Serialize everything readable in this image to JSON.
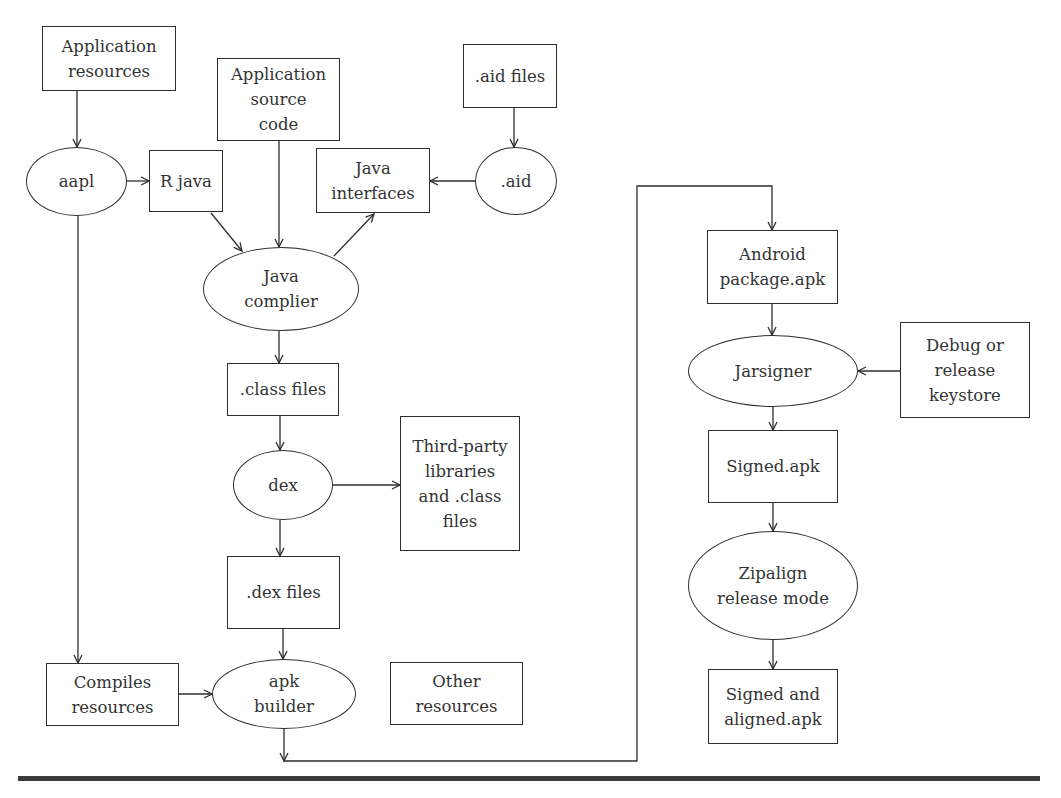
{
  "diagram": {
    "nodes": [
      {
        "id": "app-resources",
        "shape": "box",
        "label": "Application\nresources",
        "x": 42,
        "y": 26,
        "w": 134,
        "h": 65
      },
      {
        "id": "aapl",
        "shape": "ellipse",
        "label": "aapl",
        "x": 26,
        "y": 147,
        "w": 101,
        "h": 69
      },
      {
        "id": "r-java",
        "shape": "box",
        "label": "R java",
        "x": 149,
        "y": 150,
        "w": 74,
        "h": 62
      },
      {
        "id": "app-source-code",
        "shape": "box",
        "label": "Application\nsource\ncode",
        "x": 217,
        "y": 58,
        "w": 123,
        "h": 83
      },
      {
        "id": "java-interfaces",
        "shape": "box",
        "label": "Java\ninterfaces",
        "x": 316,
        "y": 148,
        "w": 114,
        "h": 65
      },
      {
        "id": "aid-files",
        "shape": "box",
        "label": ".aid files",
        "x": 463,
        "y": 44,
        "w": 94,
        "h": 64
      },
      {
        "id": "aid",
        "shape": "ellipse",
        "label": ".aid",
        "x": 475,
        "y": 147,
        "w": 82,
        "h": 68
      },
      {
        "id": "java-compiler",
        "shape": "ellipse",
        "label": "Java\ncomplier",
        "x": 203,
        "y": 247,
        "w": 156,
        "h": 84
      },
      {
        "id": "class-files",
        "shape": "box",
        "label": ".class files",
        "x": 227,
        "y": 363,
        "w": 112,
        "h": 53
      },
      {
        "id": "dex",
        "shape": "ellipse",
        "label": "dex",
        "x": 233,
        "y": 450,
        "w": 100,
        "h": 70
      },
      {
        "id": "third-party",
        "shape": "box",
        "label": "Third-party\nlibraries\nand .class\nfiles",
        "x": 400,
        "y": 416,
        "w": 120,
        "h": 135
      },
      {
        "id": "dex-files",
        "shape": "box",
        "label": ".dex files",
        "x": 227,
        "y": 556,
        "w": 113,
        "h": 73
      },
      {
        "id": "compiles-resources",
        "shape": "box",
        "label": "Compiles\nresources",
        "x": 46,
        "y": 663,
        "w": 133,
        "h": 63
      },
      {
        "id": "apk-builder",
        "shape": "ellipse",
        "label": "apk\nbuilder",
        "x": 212,
        "y": 659,
        "w": 144,
        "h": 70
      },
      {
        "id": "other-resources",
        "shape": "box",
        "label": "Other\nresources",
        "x": 390,
        "y": 662,
        "w": 133,
        "h": 63
      },
      {
        "id": "android-package",
        "shape": "box",
        "label": "Android\npackage.apk",
        "x": 707,
        "y": 230,
        "w": 131,
        "h": 74
      },
      {
        "id": "jarsigner",
        "shape": "ellipse",
        "label": "Jarsigner",
        "x": 688,
        "y": 335,
        "w": 170,
        "h": 72
      },
      {
        "id": "debug-release-keystore",
        "shape": "box",
        "label": "Debug or\nrelease\nkeystore",
        "x": 900,
        "y": 322,
        "w": 130,
        "h": 96
      },
      {
        "id": "signed-apk",
        "shape": "box",
        "label": "Signed.apk",
        "x": 708,
        "y": 430,
        "w": 130,
        "h": 73
      },
      {
        "id": "zipalign",
        "shape": "ellipse",
        "label": "Zipalign\nrelease mode",
        "x": 688,
        "y": 531,
        "w": 170,
        "h": 109
      },
      {
        "id": "signed-aligned-apk",
        "shape": "box",
        "label": "Signed and\naligned.apk",
        "x": 708,
        "y": 669,
        "w": 130,
        "h": 75
      }
    ],
    "edges": [
      {
        "from": "app-resources",
        "to": "aapl",
        "points": [
          [
            77,
            91
          ],
          [
            77,
            147
          ]
        ]
      },
      {
        "from": "aapl",
        "to": "r-java",
        "points": [
          [
            127,
            181
          ],
          [
            149,
            181
          ]
        ]
      },
      {
        "from": "r-java",
        "to": "java-compiler",
        "points": [
          [
            211,
            213
          ],
          [
            242,
            251
          ]
        ]
      },
      {
        "from": "app-source-code",
        "to": "java-compiler",
        "points": [
          [
            279,
            141
          ],
          [
            279,
            247
          ]
        ]
      },
      {
        "from": "java-compiler",
        "to": "java-interfaces",
        "points": [
          [
            334,
            256
          ],
          [
            374,
            214
          ]
        ]
      },
      {
        "from": "aid-files",
        "to": "aid",
        "points": [
          [
            514,
            108
          ],
          [
            514,
            147
          ]
        ]
      },
      {
        "from": "aid",
        "to": "java-interfaces",
        "points": [
          [
            475,
            181
          ],
          [
            430,
            181
          ]
        ]
      },
      {
        "from": "java-compiler",
        "to": "class-files",
        "points": [
          [
            279,
            331
          ],
          [
            279,
            363
          ]
        ]
      },
      {
        "from": "class-files",
        "to": "dex",
        "points": [
          [
            280,
            416
          ],
          [
            280,
            450
          ]
        ]
      },
      {
        "from": "dex",
        "to": "third-party",
        "points": [
          [
            333,
            485
          ],
          [
            400,
            485
          ]
        ]
      },
      {
        "from": "dex",
        "to": "dex-files",
        "points": [
          [
            280,
            520
          ],
          [
            280,
            556
          ]
        ]
      },
      {
        "from": "dex-files",
        "to": "apk-builder",
        "points": [
          [
            283,
            629
          ],
          [
            283,
            659
          ]
        ]
      },
      {
        "from": "aapl",
        "to": "compiles-resources",
        "points": [
          [
            78,
            216
          ],
          [
            78,
            663
          ]
        ]
      },
      {
        "from": "compiles-resources",
        "to": "apk-builder",
        "points": [
          [
            179,
            694
          ],
          [
            212,
            694
          ]
        ]
      },
      {
        "from": "apk-builder",
        "to": "android-package",
        "points": [
          [
            284,
            729
          ],
          [
            284,
            761
          ],
          [
            637,
            761
          ],
          [
            637,
            186
          ],
          [
            772,
            186
          ],
          [
            772,
            230
          ]
        ],
        "arrow_at_start_down": true
      },
      {
        "from": "android-package",
        "to": "jarsigner",
        "points": [
          [
            772,
            304
          ],
          [
            772,
            335
          ]
        ]
      },
      {
        "from": "debug-release-keystore",
        "to": "jarsigner",
        "points": [
          [
            900,
            371
          ],
          [
            858,
            371
          ]
        ]
      },
      {
        "from": "jarsigner",
        "to": "signed-apk",
        "points": [
          [
            773,
            407
          ],
          [
            773,
            430
          ]
        ]
      },
      {
        "from": "signed-apk",
        "to": "zipalign",
        "points": [
          [
            773,
            503
          ],
          [
            773,
            531
          ]
        ]
      },
      {
        "from": "zipalign",
        "to": "signed-aligned-apk",
        "points": [
          [
            773,
            640
          ],
          [
            773,
            669
          ]
        ]
      }
    ],
    "colors": {
      "stroke": "#2e2e2e",
      "text": "#333333",
      "background": "#ffffff",
      "rule": "#3a3a3a"
    }
  }
}
